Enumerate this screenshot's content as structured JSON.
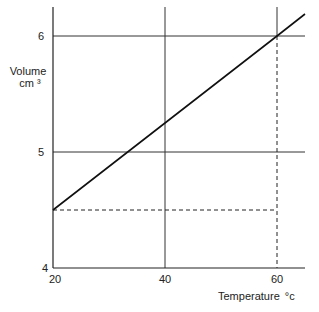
{
  "chart_data": {
    "type": "line",
    "title": "",
    "xlabel": "Temperature °c",
    "ylabel": "Volume cm 3",
    "ylabel_lines": [
      "Volume",
      "cm ³"
    ],
    "xlabel_main": "Temperature",
    "xlabel_unit": "°c",
    "xlim": [
      20,
      65
    ],
    "ylim": [
      4,
      6.25
    ],
    "xticks": [
      20,
      40,
      60
    ],
    "yticks": [
      4,
      5,
      6
    ],
    "grid": true,
    "series": [
      {
        "name": "Volume vs Temperature",
        "x": [
          20,
          40,
          60,
          65
        ],
        "y": [
          4.5,
          5.25,
          6.0,
          6.19
        ]
      }
    ],
    "annotations": [
      {
        "type": "dashed-horizontal",
        "y": 4.5,
        "x_from": 20,
        "x_to": 60
      },
      {
        "type": "dashed-vertical",
        "x": 60,
        "y_from": 4.5,
        "y_to": 6.0
      }
    ]
  }
}
